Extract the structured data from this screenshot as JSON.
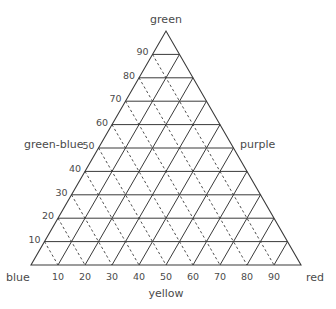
{
  "diagram": {
    "type": "ternary",
    "vertices": {
      "top": "green",
      "left": "blue",
      "right": "red"
    },
    "axis_labels": {
      "left_side": "green-blue",
      "right_side": "purple",
      "bottom": "yellow"
    },
    "left_ticks": [
      "10",
      "20",
      "30",
      "40",
      "50",
      "60",
      "70",
      "80",
      "90"
    ],
    "bottom_ticks": [
      "10",
      "20",
      "30",
      "40",
      "50",
      "60",
      "70",
      "80",
      "90"
    ],
    "grid": {
      "divisions": 10,
      "horizontal_lines": "solid",
      "left_parallel_lines": "solid",
      "right_parallel_lines": "dashed"
    },
    "colors": {
      "line": "#3a3a3a",
      "text": "#4a4a4a",
      "background": "#ffffff"
    }
  }
}
